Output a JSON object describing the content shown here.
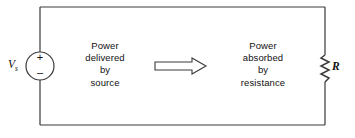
{
  "figure": {
    "type": "circuit-diagram",
    "width": 355,
    "height": 138,
    "background": "#ffffff",
    "line_color": "#3a3a3a"
  },
  "source": {
    "label": "V",
    "subscript": "s",
    "polarity_plus": "+",
    "polarity_minus": "–",
    "symbol": "voltage-source-circle"
  },
  "resistor": {
    "label": "R",
    "symbol": "zigzag-resistor"
  },
  "arrow": {
    "direction": "right",
    "style": "hollow-block-arrow"
  },
  "captions": {
    "left": {
      "lines": [
        "Power",
        "delivered",
        "by",
        "source"
      ],
      "line1": "Power",
      "line2": "delivered",
      "line3": "by",
      "line4": "source"
    },
    "right": {
      "lines": [
        "Power",
        "absorbed",
        "by",
        "resistance"
      ],
      "line1": "Power",
      "line2": "absorbed",
      "line3": "by",
      "line4": "resistance"
    }
  }
}
